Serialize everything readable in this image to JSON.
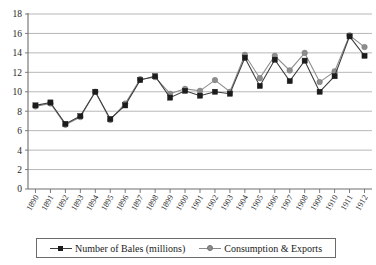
{
  "chart_data": {
    "type": "line",
    "title": "",
    "xlabel": "",
    "ylabel": "",
    "ylim": [
      0,
      18
    ],
    "ytick_step": 2,
    "yticks": [
      0,
      2,
      4,
      6,
      8,
      10,
      12,
      14,
      16,
      18
    ],
    "grid": true,
    "legend_position": "bottom",
    "categories": [
      "1890",
      "1891",
      "1892",
      "1893",
      "1894",
      "1895",
      "1896",
      "1897",
      "1898",
      "1899",
      "1900",
      "1901",
      "1902",
      "1903",
      "1904",
      "1905",
      "1906",
      "1907",
      "1908",
      "1909",
      "1910",
      "1911",
      "1912"
    ],
    "series": [
      {
        "name": "Number of Bales (millions)",
        "color": "#1c1c1c",
        "marker": "square",
        "values": [
          8.6,
          8.9,
          6.7,
          7.5,
          10.0,
          7.2,
          8.6,
          11.2,
          11.6,
          9.4,
          10.1,
          9.6,
          10.0,
          9.8,
          13.5,
          10.6,
          13.3,
          11.1,
          13.2,
          10.0,
          11.6,
          15.7,
          13.7
        ]
      },
      {
        "name": "Consumption & Exports",
        "color": "#8d8d8d",
        "marker": "circle",
        "values": [
          8.5,
          8.8,
          6.6,
          7.4,
          10.0,
          7.1,
          8.8,
          11.3,
          11.5,
          9.8,
          10.3,
          10.1,
          11.2,
          10.0,
          13.8,
          11.4,
          13.7,
          12.2,
          14.0,
          11.0,
          12.1,
          15.8,
          14.6
        ]
      }
    ]
  },
  "legend": {
    "entries": [
      {
        "label": "Number of Bales (millions)"
      },
      {
        "label": "Consumption & Exports"
      }
    ]
  }
}
